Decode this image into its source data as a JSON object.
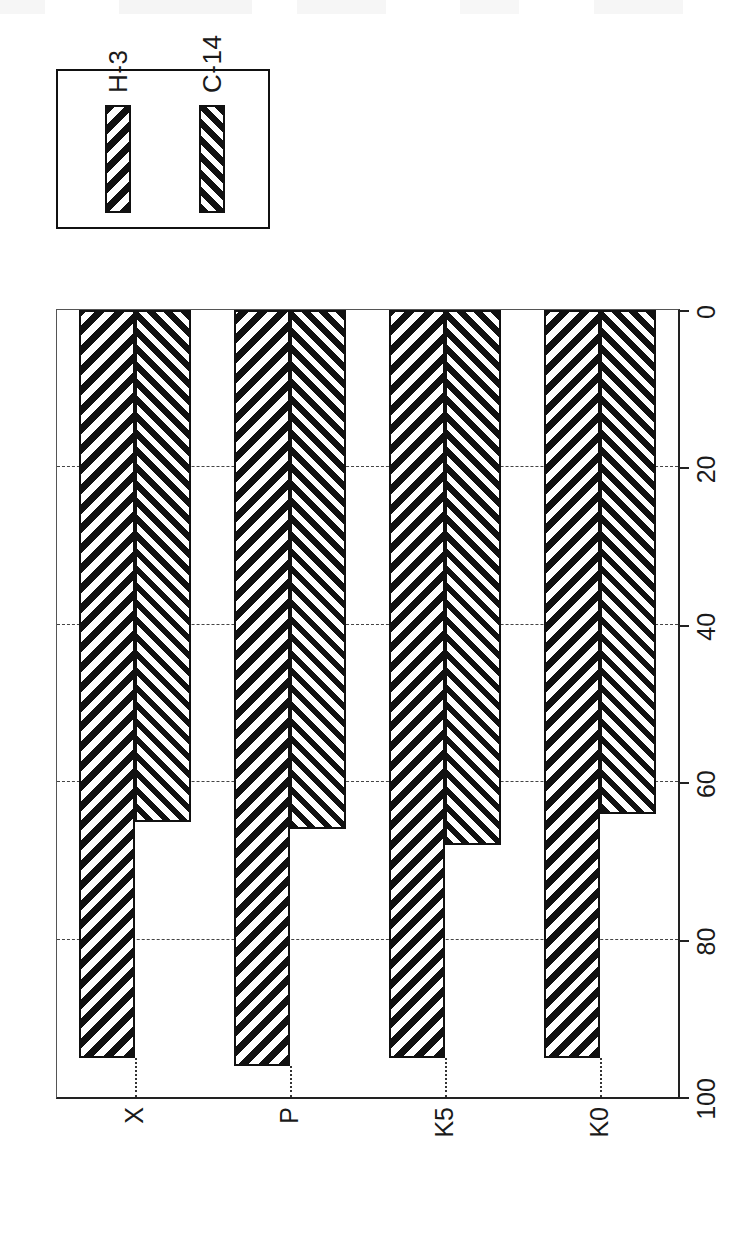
{
  "chart_data": {
    "type": "bar",
    "orientation": "horizontal-on-page",
    "title": "",
    "subtitle": "",
    "xlabel": "",
    "ylabel": "",
    "categories": [
      "X",
      "P",
      "K5",
      "K0"
    ],
    "series": [
      {
        "name": "H-3",
        "values": [
          95,
          96,
          95,
          95
        ]
      },
      {
        "name": "C-14",
        "values": [
          65,
          66,
          68,
          64
        ]
      }
    ],
    "value_axis": {
      "ticks": [
        0,
        20,
        40,
        60,
        80,
        100
      ],
      "tick_labels": [
        "0",
        "20",
        "40",
        "60",
        "80",
        "100"
      ],
      "min": 0,
      "max": 100,
      "direction": "right-to-left-on-page"
    },
    "grid": true,
    "grid_style": "dashed-vertical",
    "legend": {
      "position": "top-left-rotated",
      "entries": [
        {
          "label": "H-3",
          "pattern": "diagonal-hatch-sparse"
        },
        {
          "label": "C-14",
          "pattern": "diagonal-hatch-dense"
        }
      ]
    },
    "colors": {
      "ink": "#111111",
      "paper": "#ffffff",
      "grid": "#444444",
      "axis": "#222222"
    },
    "style": "monochrome-hatched-scanned-figure",
    "rotation_degrees": -90
  },
  "legend": {
    "entries": [
      {
        "label": "H-3"
      },
      {
        "label": "C-14"
      }
    ]
  },
  "value_axis": {
    "labels": [
      "0",
      "20",
      "40",
      "60",
      "80",
      "100"
    ]
  },
  "category_axis": {
    "labels": [
      "X",
      "P",
      "K5",
      "K0"
    ]
  }
}
